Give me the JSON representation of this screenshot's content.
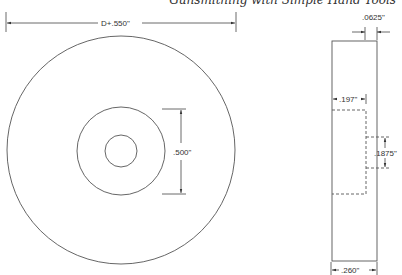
{
  "header": {
    "running_title": "Gunsmithing with Simple Hand Tools"
  },
  "front_view": {
    "outer_diameter_label": "D+.550\"",
    "hub_diameter_label": ".500\""
  },
  "side_view": {
    "flange_thickness_label": ".0625\"",
    "recess_depth_label": ".197\"",
    "bore_label": ".1875\"",
    "overall_width_label": ".260\""
  },
  "colors": {
    "line": "#444444",
    "background": "#ffffff"
  }
}
